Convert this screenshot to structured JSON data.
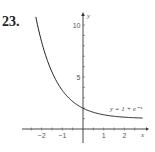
{
  "problem_number": "23.",
  "chart_data": {
    "type": "line",
    "title": "",
    "equation_label": "y = 1 + e⁻ˣ",
    "xlabel": "x",
    "ylabel": "y",
    "xlim": [
      -2.7,
      2.8
    ],
    "ylim": [
      0,
      10.8
    ],
    "x_ticks": [
      -2,
      -1,
      1,
      2
    ],
    "x_tick_labels": [
      "−2",
      "−1",
      "1",
      "2"
    ],
    "y_ticks": [
      5,
      10
    ],
    "y_tick_labels": [
      "5",
      "10"
    ],
    "grid": false,
    "series": [
      {
        "name": "y = 1 + e^-x",
        "x": [
          -2.3,
          -2.0,
          -1.5,
          -1.0,
          -0.5,
          0,
          0.5,
          1.0,
          1.5,
          2.0,
          2.5,
          2.8
        ],
        "y": [
          10.97,
          8.39,
          5.48,
          3.72,
          2.65,
          2.0,
          1.61,
          1.37,
          1.22,
          1.14,
          1.08,
          1.06
        ]
      }
    ]
  }
}
